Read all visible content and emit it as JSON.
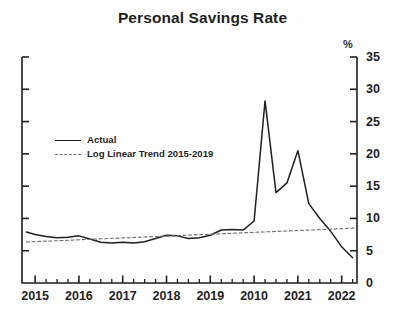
{
  "chart_data": {
    "type": "line",
    "title": "Personal Savings Rate",
    "xlabel": "",
    "ylabel": "%",
    "unit_label": "%",
    "xlim": [
      2014.7,
      2022.35
    ],
    "ylim": [
      0,
      35
    ],
    "ytick_values": [
      0,
      5,
      10,
      15,
      20,
      25,
      30,
      35
    ],
    "ytick_labels": [
      "0",
      "5",
      "10",
      "15",
      "20",
      "25",
      "30",
      "35"
    ],
    "xtick_values": [
      2015,
      2016,
      2017,
      2018,
      2019,
      2020,
      2021,
      2022
    ],
    "xtick_labels": [
      "2015",
      "2016",
      "2017",
      "2018",
      "2019",
      "2010",
      "2021",
      "2022"
    ],
    "minor_ticks_per_interval": 3,
    "grid": false,
    "legend_position": "inside-upper-left",
    "axis_color": "#1f1f1f",
    "series": [
      {
        "name": "Actual",
        "style": "solid",
        "color": "#1f1f1f",
        "x": [
          2014.8,
          2015.0,
          2015.25,
          2015.5,
          2015.75,
          2016.0,
          2016.25,
          2016.5,
          2016.75,
          2017.0,
          2017.25,
          2017.5,
          2017.75,
          2018.0,
          2018.25,
          2018.5,
          2018.75,
          2019.0,
          2019.25,
          2019.5,
          2019.75,
          2020.0,
          2020.25,
          2020.5,
          2020.75,
          2021.0,
          2021.25,
          2021.5,
          2021.75,
          2022.0,
          2022.25
        ],
        "values": [
          7.9,
          7.5,
          7.2,
          7.0,
          7.1,
          7.3,
          6.8,
          6.3,
          6.2,
          6.3,
          6.2,
          6.4,
          6.9,
          7.4,
          7.3,
          6.9,
          7.0,
          7.4,
          8.2,
          8.3,
          8.2,
          9.6,
          28.2,
          14.0,
          15.5,
          20.5,
          12.3,
          10.0,
          8.0,
          5.6,
          3.9
        ]
      },
      {
        "name": "Log Linear Trend 2015-2019",
        "style": "dashed",
        "color": "#6e6e6e",
        "x": [
          2014.8,
          2022.3
        ],
        "values": [
          6.35,
          8.5
        ]
      }
    ],
    "legend": [
      {
        "label": "Actual",
        "style": "solid"
      },
      {
        "label": "Log Linear Trend 2015-2019",
        "style": "dashed"
      }
    ]
  }
}
